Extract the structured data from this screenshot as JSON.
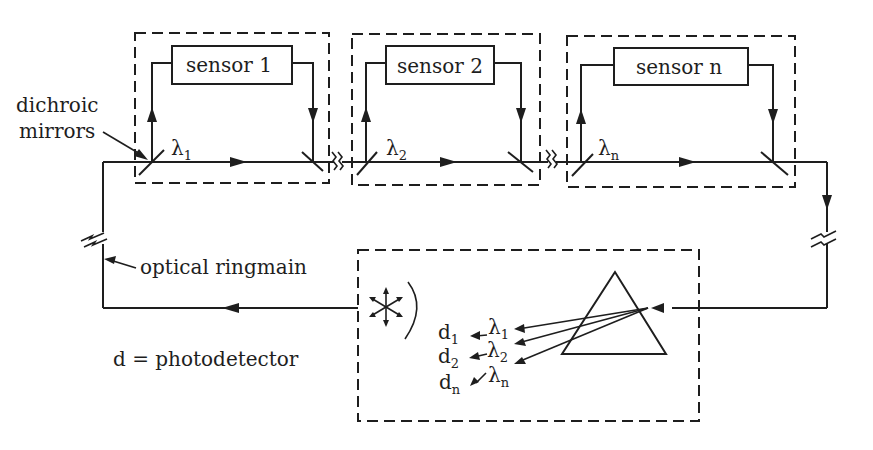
{
  "diagram": {
    "type": "optical sensor network (wavelength multiplexed ringmain)",
    "sensors": [
      {
        "label": "sensor 1",
        "wavelength": "λ",
        "wavelength_sub": "1"
      },
      {
        "label": "sensor 2",
        "wavelength": "λ",
        "wavelength_sub": "2"
      },
      {
        "label": "sensor n",
        "wavelength": "λ",
        "wavelength_sub": "n"
      }
    ],
    "labels": {
      "dichroic_line1": "dichroic",
      "dichroic_line2": "mirrors",
      "ringmain": "optical ringmain",
      "legend": "d = photodetector"
    },
    "detector": {
      "outputs": [
        {
          "d": "d",
          "d_sub": "1",
          "lambda": "λ",
          "lambda_sub": "1"
        },
        {
          "d": "d",
          "d_sub": "2",
          "lambda": "λ",
          "lambda_sub": "2"
        },
        {
          "d": "d",
          "d_sub": "n",
          "lambda": "λ",
          "lambda_sub": "n"
        }
      ],
      "source_icon": "light-source-icon",
      "dispersion_element": "prism"
    },
    "colors": {
      "ink": "#1e1e1e",
      "background": "#ffffff"
    }
  }
}
